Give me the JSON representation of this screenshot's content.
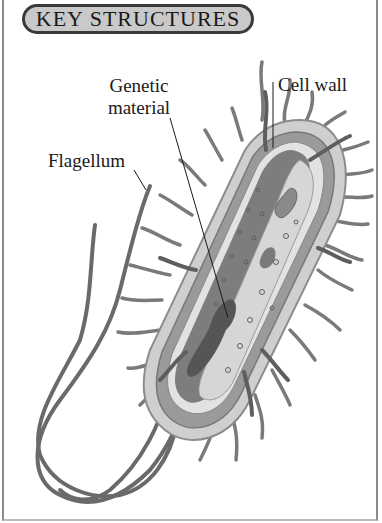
{
  "title": "KEY STRUCTURES",
  "labels": {
    "genetic_material_line1": "Genetic",
    "genetic_material_line2": "material",
    "cell_wall": "Cell wall",
    "flagellum": "Flagellum"
  },
  "colors": {
    "title_fill": "#c9c9c9",
    "title_border": "#3a3a3a",
    "capsule": "#cfcfcf",
    "wall": "#9a9a9a",
    "cytoplasm": "#7d7d7d",
    "light_region": "#d9d9d9",
    "nucleoid": "#555555",
    "pili": "#6e6e6e",
    "flagellum": "#6a6a6a"
  }
}
